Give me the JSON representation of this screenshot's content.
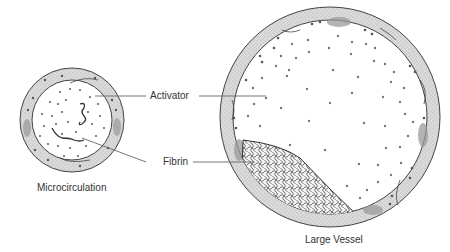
{
  "labels": {
    "activator": "Activator",
    "fibrin": "Fibrin",
    "microcirculation": "Microcirculation",
    "large_vessel": "Large Vessel"
  },
  "colors": {
    "wall_fill": "#d6d6d6",
    "outline": "#444444",
    "dot": "#6a6a6a",
    "leader_line": "#666666",
    "text": "#333333"
  }
}
